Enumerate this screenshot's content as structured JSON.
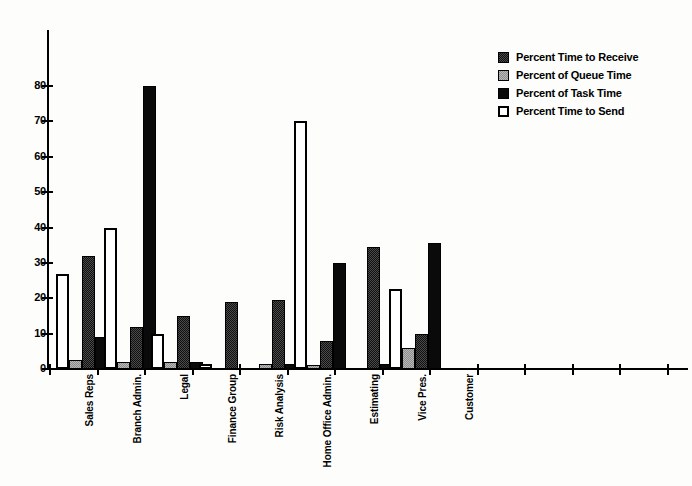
{
  "chart_data": {
    "type": "bar",
    "title": "",
    "subtitle": "",
    "xlabel": "",
    "ylabel": "",
    "ylim": [
      0,
      80
    ],
    "yticks": [
      0,
      10,
      20,
      30,
      40,
      50,
      60,
      70,
      80
    ],
    "grid": false,
    "legend_position": "top-right",
    "categories": [
      "Sales Reps",
      "Branch Admin.",
      "Legal",
      "Finance Group",
      "Risk Analysis",
      "Home Office Admin.",
      "Estimating",
      "Vice Pres.",
      "Customer"
    ],
    "series": [
      {
        "name": "Percent Time to Send",
        "swatch": "white-outline",
        "color": "#ffffff",
        "values": [
          27,
          40,
          10,
          1.5,
          0,
          70,
          0,
          22.5,
          0
        ]
      },
      {
        "name": "Percent of Queue Time",
        "swatch": "light-gray-dither",
        "color": "#b9b9b9",
        "values": [
          2.5,
          2,
          2,
          0,
          1.5,
          1,
          0,
          6,
          0
        ]
      },
      {
        "name": "Percent Time to Receive",
        "swatch": "dark-crosshatch",
        "color": "#4a4a4a",
        "values": [
          32,
          12,
          15,
          19,
          19.5,
          8,
          34.5,
          10,
          0
        ]
      },
      {
        "name": "Percent of Task Time",
        "swatch": "solid-black",
        "color": "#0a0a0a",
        "values": [
          9,
          80,
          2,
          0,
          1.5,
          30,
          1.5,
          35.5,
          0
        ]
      }
    ],
    "legend_order": [
      "Percent Time to Receive",
      "Percent of Queue Time",
      "Percent of Task Time",
      "Percent Time to Send"
    ]
  },
  "legend": {
    "items": [
      {
        "label": "Percent Time to Receive",
        "swatch": "dark-crosshatch"
      },
      {
        "label": "Percent of Queue Time",
        "swatch": "light-gray-dither"
      },
      {
        "label": "Percent of Task Time",
        "swatch": "solid-black"
      },
      {
        "label": "Percent Time to Send",
        "swatch": "white-outline"
      }
    ]
  }
}
